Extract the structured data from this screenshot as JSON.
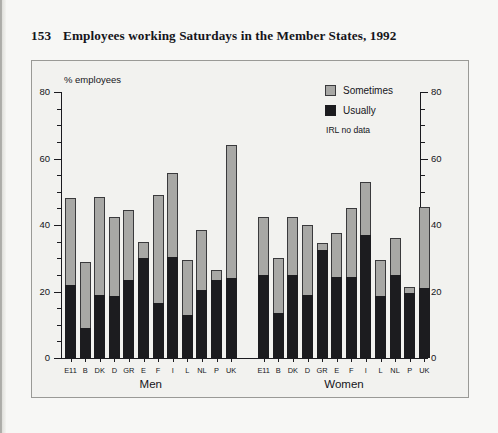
{
  "title": {
    "number": "153",
    "text": "Employees working Saturdays in the Member States, 1992"
  },
  "legend": {
    "position": "top-right",
    "items": [
      {
        "label": "Sometimes",
        "color": "#a8a8a5"
      },
      {
        "label": "Usually",
        "color": "#1c1c1f"
      }
    ],
    "note": "IRL no data"
  },
  "axis": {
    "y_title": "% employees",
    "y_ticks": [
      "0",
      "20",
      "40",
      "60",
      "80"
    ],
    "y_ticks_right": [
      "0",
      "20",
      "40",
      "60",
      "80"
    ],
    "y_min": 0,
    "y_max": 80
  },
  "groups": [
    {
      "label": "Men"
    },
    {
      "label": "Women"
    }
  ],
  "chart_data": {
    "type": "bar",
    "title": "Employees working Saturdays in the Member States, 1992",
    "subtitle": "",
    "xlabel": "",
    "ylabel": "% employees",
    "ylim": [
      0,
      80
    ],
    "yticks": [
      0,
      20,
      40,
      60,
      80
    ],
    "grid": false,
    "stacked": true,
    "legend_position": "top-right",
    "annotations": [
      "IRL no data"
    ],
    "groups": [
      "Men",
      "Women"
    ],
    "categories": [
      "E11",
      "B",
      "DK",
      "D",
      "GR",
      "E",
      "F",
      "I",
      "L",
      "NL",
      "P",
      "UK"
    ],
    "series": [
      {
        "name": "Usually",
        "color": "#1c1c1f",
        "Men": [
          22,
          9,
          19,
          18.5,
          23.5,
          30,
          16.5,
          30.5,
          13,
          20.5,
          23.5,
          24
        ],
        "Women": [
          25,
          13.5,
          25,
          19,
          32.5,
          24.5,
          24.5,
          37,
          18.5,
          25,
          19.5,
          21
        ]
      },
      {
        "name": "Sometimes",
        "color": "#a8a8a5",
        "Men": [
          26,
          20,
          29.5,
          24,
          21,
          5,
          32.5,
          25,
          16.5,
          18,
          3,
          40
        ],
        "Women": [
          17.5,
          16.5,
          17.5,
          21,
          2,
          13,
          20.5,
          16,
          11,
          11,
          2,
          24.5
        ]
      }
    ],
    "totals": {
      "Men": [
        48,
        29,
        48.5,
        42.5,
        44.5,
        35,
        49,
        55.5,
        29.5,
        38.5,
        26.5,
        64
      ],
      "Women": [
        42.5,
        30,
        42.5,
        40,
        34.5,
        37.5,
        45,
        53,
        29.5,
        36,
        21.5,
        45.5
      ]
    }
  }
}
